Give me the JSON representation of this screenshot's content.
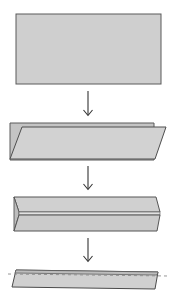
{
  "diagram": {
    "type": "folding-instructions",
    "colors": {
      "paper_fill": "#cfcfcf",
      "paper_back_fill": "#c4c4c4",
      "edge_stroke": "#555555",
      "arrow_stroke": "#333333",
      "fold_line": "#8a8a8a",
      "background": "#ffffff"
    },
    "steps": [
      {
        "index": 1,
        "name": "flat-rectangle",
        "description": "Flat rectangular sheet"
      },
      {
        "index": 2,
        "name": "folded-in-half",
        "description": "Sheet folded in half lengthwise, top layer slanted"
      },
      {
        "index": 3,
        "name": "folded-edges",
        "description": "Long edges folded in to the center, forming a channel"
      },
      {
        "index": 4,
        "name": "folded-strip",
        "description": "Folded again into a narrow strip with dashed fold guide"
      }
    ],
    "arrows": [
      {
        "from": 1,
        "to": 2,
        "direction": "down"
      },
      {
        "from": 2,
        "to": 3,
        "direction": "down"
      },
      {
        "from": 3,
        "to": 4,
        "direction": "down"
      }
    ]
  }
}
